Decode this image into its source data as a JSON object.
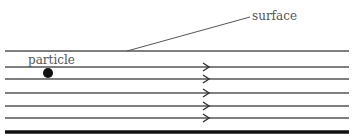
{
  "diagram": {
    "labels": {
      "surface": "surface",
      "particle": "particle",
      "top_cut_text": "..."
    },
    "colors": {
      "line": "#555555",
      "bed": "#111111",
      "particle": "#111111",
      "text": "#555555"
    },
    "layers": [
      {
        "y": 51,
        "arrow": false
      },
      {
        "y": 67,
        "arrow": true
      },
      {
        "y": 79,
        "arrow": true
      },
      {
        "y": 93,
        "arrow": true
      },
      {
        "y": 106,
        "arrow": true
      },
      {
        "y": 118,
        "arrow": true
      }
    ],
    "bed_y": 132,
    "arrow_x": 207,
    "particle": {
      "cx": 48,
      "cy": 73,
      "r": 5
    }
  }
}
